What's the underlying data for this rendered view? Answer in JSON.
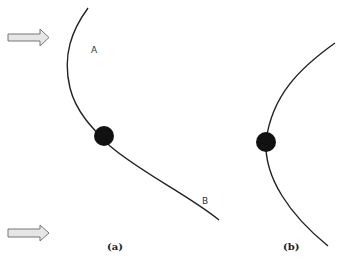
{
  "figure": {
    "panel_a": {
      "caption": "(a)",
      "point_label_a": "A",
      "point_label_b": "B",
      "arrows": [
        "incoming-arrow-top",
        "incoming-arrow-bottom"
      ]
    },
    "panel_b": {
      "caption": "(b)"
    },
    "colors": {
      "curve": "#222222",
      "ball": "#111111",
      "arrow_fill": "#e6e6e6",
      "arrow_stroke": "#777777"
    }
  }
}
